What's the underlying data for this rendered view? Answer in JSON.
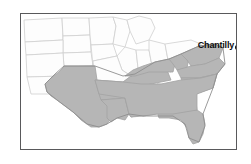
{
  "figure": {
    "type": "map",
    "title": "",
    "frame": {
      "visible": true,
      "border_color": "#59595b"
    },
    "background_color": "#ffffff"
  },
  "map": {
    "region_name": "United States",
    "projection_note": "",
    "shaded_region_color": "#b6b6b6",
    "unshaded_region_color": "#fdfdfd",
    "border_color": "#cfcfcf",
    "shaded_states": [
      "Texas",
      "Louisiana",
      "Arkansas",
      "Mississippi",
      "Alabama",
      "Tennessee",
      "Kentucky",
      "Georgia",
      "Florida",
      "South Carolina",
      "North Carolina",
      "Virginia",
      "West Virginia"
    ],
    "unshaded_states": [
      "Montana",
      "North Dakota",
      "South Dakota",
      "Minnesota",
      "Wisconsin",
      "Michigan",
      "Wyoming",
      "Nebraska",
      "Iowa",
      "Illinois",
      "Indiana",
      "Ohio",
      "Colorado",
      "Kansas",
      "Missouri",
      "New Mexico",
      "Oklahoma",
      "Pennsylvania",
      "Maryland"
    ]
  },
  "annotations": {
    "city": {
      "label": "Chantilly",
      "marker_shape": "filled-circle",
      "marker_color": "#111111",
      "label_color": "#0b0b0b",
      "label_position": "left-of-marker"
    }
  }
}
